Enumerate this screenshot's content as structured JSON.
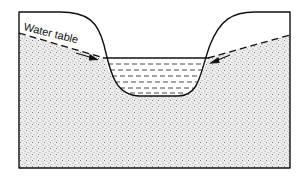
{
  "diagram": {
    "type": "cross-section",
    "labels": {
      "water_table": "Water table"
    },
    "elements": [
      "ground-surface",
      "sediment-fill",
      "water-table-left",
      "water-table-right",
      "stream-channel",
      "stream-water",
      "flow-arrow-left",
      "flow-arrow-right"
    ],
    "colors": {
      "outline": "#111111",
      "sediment_bg": "#e6e6e6",
      "water_dash": "#333333",
      "background": "#ffffff"
    }
  }
}
